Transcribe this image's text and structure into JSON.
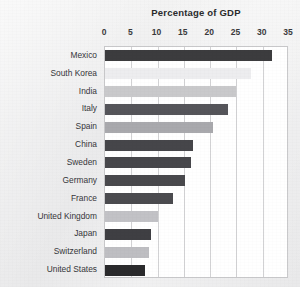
{
  "chart_data": {
    "type": "bar",
    "orientation": "horizontal",
    "title": "Percentage of GDP",
    "xlabel": "",
    "ylabel": "",
    "xlim": [
      0,
      35
    ],
    "xticks": [
      0,
      5,
      10,
      15,
      20,
      25,
      30,
      35
    ],
    "xtick_labels": [
      "0",
      "5",
      "10",
      "15",
      "20",
      "25",
      "30",
      "35"
    ],
    "grid": "vertical",
    "legend": "none",
    "categories": [
      "Mexico",
      "South Korea",
      "India",
      "Italy",
      "Spain",
      "China",
      "Sweden",
      "Germany",
      "France",
      "United Kingdom",
      "Japan",
      "Switzerland",
      "United States"
    ],
    "values": [
      31.7,
      27.7,
      25.0,
      23.4,
      20.6,
      16.7,
      16.4,
      15.3,
      13.0,
      10.0,
      8.8,
      8.3,
      7.7
    ],
    "bar_colors": [
      "#3c3c3e",
      "#ededef",
      "#c9c9cb",
      "#55555a",
      "#a9a9ad",
      "#46464a",
      "#47474b",
      "#49494d",
      "#4b4b4f",
      "#c2c2c6",
      "#3f3f43",
      "#bebec2",
      "#2b2b2d"
    ]
  },
  "style": {
    "plot_background": "#ffffff",
    "figure_background": "#ecedee",
    "gridline_color": "#d2d2d4",
    "axis_border_color": "#c9c9cb",
    "title_color": "#2b2b2d",
    "tick_label_color": "#3a3a3c",
    "category_label_color": "#36363a"
  }
}
